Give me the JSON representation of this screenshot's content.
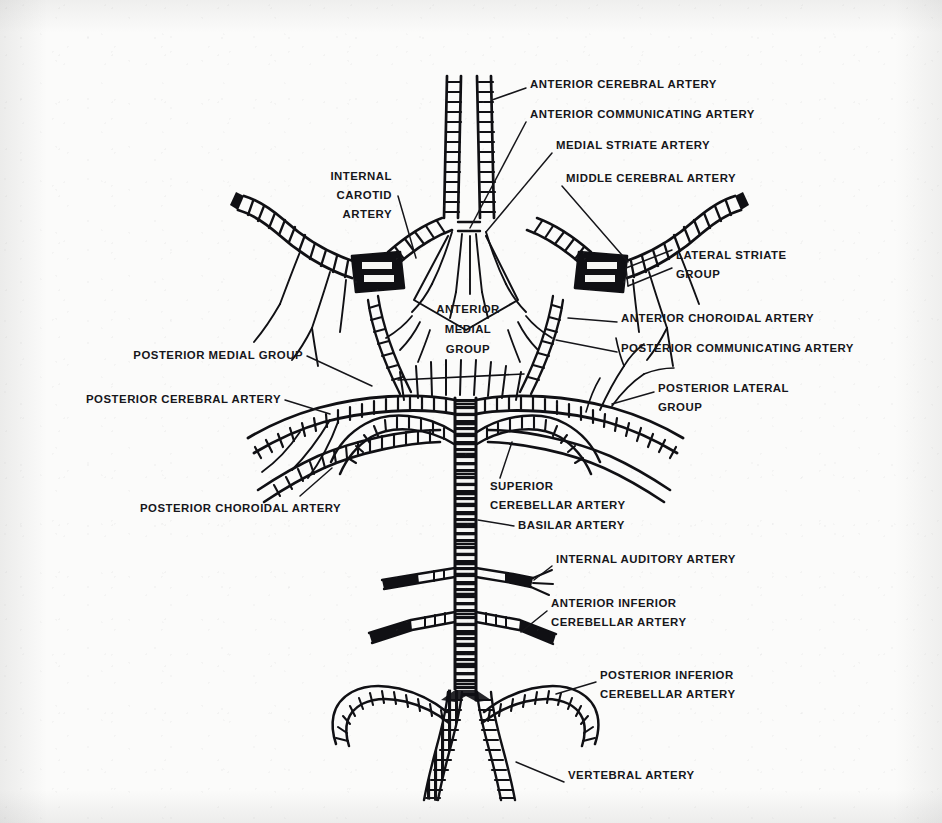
{
  "figure": {
    "ink_color": "#101014",
    "paper_color": "#fbfbfa"
  },
  "labels": [
    {
      "id": "anterior-cerebral-artery",
      "lines": [
        "ANTERIOR CEREBRAL ARTERY"
      ],
      "x": 530,
      "y": 88,
      "align": "start"
    },
    {
      "id": "anterior-communicating-artery",
      "lines": [
        "ANTERIOR COMMUNICATING ARTERY"
      ],
      "x": 530,
      "y": 118,
      "align": "start"
    },
    {
      "id": "medial-striate-artery",
      "lines": [
        "MEDIAL STRIATE ARTERY"
      ],
      "x": 556,
      "y": 149,
      "align": "start"
    },
    {
      "id": "middle-cerebral-artery",
      "lines": [
        "MIDDLE CEREBRAL ARTERY"
      ],
      "x": 566,
      "y": 182,
      "align": "start"
    },
    {
      "id": "internal-carotid-artery",
      "lines": [
        "INTERNAL",
        "CAROTID",
        "ARTERY"
      ],
      "x": 392,
      "y": 180,
      "align": "end"
    },
    {
      "id": "lateral-striate-group",
      "lines": [
        "LATERAL STRIATE",
        "GROUP"
      ],
      "x": 676,
      "y": 259,
      "align": "start"
    },
    {
      "id": "anterior-choroidal-artery",
      "lines": [
        "ANTERIOR CHOROIDAL ARTERY"
      ],
      "x": 621,
      "y": 322,
      "align": "start"
    },
    {
      "id": "posterior-communicating-artery",
      "lines": [
        "POSTERIOR COMMUNICATING ARTERY"
      ],
      "x": 621,
      "y": 352,
      "align": "start"
    },
    {
      "id": "anterior-medial-group",
      "lines": [
        "ANTERIOR",
        "MEDIAL",
        "GROUP"
      ],
      "x": 468,
      "y": 313,
      "align": "middle"
    },
    {
      "id": "posterior-medial-group",
      "lines": [
        "POSTERIOR MEDIAL GROUP"
      ],
      "x": 303,
      "y": 359,
      "align": "end"
    },
    {
      "id": "posterior-cerebral-artery",
      "lines": [
        "POSTERIOR CEREBRAL ARTERY"
      ],
      "x": 281,
      "y": 403,
      "align": "end"
    },
    {
      "id": "posterior-lateral-group",
      "lines": [
        "POSTERIOR LATERAL",
        "GROUP"
      ],
      "x": 658,
      "y": 392,
      "align": "start"
    },
    {
      "id": "posterior-choroidal-artery",
      "lines": [
        "POSTERIOR CHOROIDAL ARTERY"
      ],
      "x": 140,
      "y": 512,
      "align": "start"
    },
    {
      "id": "superior-cerebellar-artery",
      "lines": [
        "SUPERIOR",
        "CEREBELLAR ARTERY"
      ],
      "x": 490,
      "y": 490,
      "align": "start"
    },
    {
      "id": "basilar-artery",
      "lines": [
        "BASILAR ARTERY"
      ],
      "x": 518,
      "y": 529,
      "align": "start"
    },
    {
      "id": "internal-auditory-artery",
      "lines": [
        "INTERNAL AUDITORY ARTERY"
      ],
      "x": 556,
      "y": 563,
      "align": "start"
    },
    {
      "id": "anterior-inferior-cerebellar-artery",
      "lines": [
        "ANTERIOR INFERIOR",
        "CEREBELLAR ARTERY"
      ],
      "x": 551,
      "y": 607,
      "align": "start"
    },
    {
      "id": "posterior-inferior-cerebellar-artery",
      "lines": [
        "POSTERIOR INFERIOR",
        "CEREBELLAR ARTERY"
      ],
      "x": 600,
      "y": 679,
      "align": "start"
    },
    {
      "id": "vertebral-artery",
      "lines": [
        "VERTEBRAL ARTERY"
      ],
      "x": 568,
      "y": 779,
      "align": "start"
    }
  ]
}
